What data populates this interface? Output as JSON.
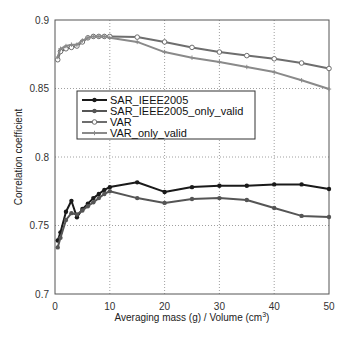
{
  "chart_data": {
    "type": "line",
    "title": "",
    "xlabel": "Averaging mass (g) / Volume (cm",
    "xlabel_sup": "3",
    "xlabel_close": ")",
    "ylabel": "Correlation coefficient",
    "xlim": [
      0,
      50
    ],
    "ylim": [
      0.7,
      0.9
    ],
    "xticks": [
      "0",
      "10",
      "20",
      "30",
      "40",
      "50"
    ],
    "yticks": [
      "0.7",
      "0.75",
      "0.8",
      "0.85",
      "0.9"
    ],
    "grid": true,
    "legend_position": "center-left inside",
    "series": [
      {
        "name": "SAR_IEEE2005",
        "color": "#1a1a1a",
        "marker": "filled-dot",
        "x": [
          0.5,
          1,
          2,
          3,
          4,
          5,
          6,
          7,
          8,
          9,
          10,
          15,
          20,
          25,
          30,
          35,
          40,
          45,
          50
        ],
        "y": [
          0.739,
          0.745,
          0.76,
          0.768,
          0.756,
          0.762,
          0.766,
          0.77,
          0.773,
          0.776,
          0.778,
          0.7815,
          0.7745,
          0.778,
          0.779,
          0.779,
          0.78,
          0.78,
          0.7766
        ]
      },
      {
        "name": "SAR_IEEE2005_only_valid",
        "color": "#555555",
        "marker": "filled-dot",
        "x": [
          0.5,
          1,
          2,
          3,
          4,
          5,
          6,
          7,
          8,
          9,
          10,
          15,
          20,
          25,
          30,
          35,
          40,
          45,
          50
        ],
        "y": [
          0.734,
          0.741,
          0.754,
          0.759,
          0.758,
          0.761,
          0.764,
          0.767,
          0.77,
          0.773,
          0.775,
          0.77,
          0.7665,
          0.7693,
          0.77,
          0.7686,
          0.7628,
          0.757,
          0.7562
        ]
      },
      {
        "name": "VAR",
        "color": "#6e6e6e",
        "marker": "open-circle",
        "x": [
          0.5,
          1,
          2,
          3,
          4,
          5,
          6,
          7,
          8,
          9,
          10,
          15,
          20,
          25,
          30,
          35,
          40,
          45,
          50
        ],
        "y": [
          0.871,
          0.877,
          0.879,
          0.88,
          0.881,
          0.884,
          0.887,
          0.888,
          0.888,
          0.888,
          0.888,
          0.8875,
          0.884,
          0.88,
          0.8766,
          0.874,
          0.8717,
          0.8686,
          0.8646
        ]
      },
      {
        "name": "VAR_only_valid",
        "color": "#8a8a8a",
        "marker": "plus",
        "x": [
          0.5,
          1,
          2,
          3,
          4,
          5,
          6,
          7,
          8,
          9,
          10,
          15,
          20,
          25,
          30,
          35,
          40,
          45,
          50
        ],
        "y": [
          0.873,
          0.879,
          0.881,
          0.882,
          0.882,
          0.885,
          0.887,
          0.888,
          0.888,
          0.888,
          0.887,
          0.884,
          0.8766,
          0.8725,
          0.8693,
          0.8657,
          0.862,
          0.856,
          0.8496
        ]
      }
    ]
  }
}
